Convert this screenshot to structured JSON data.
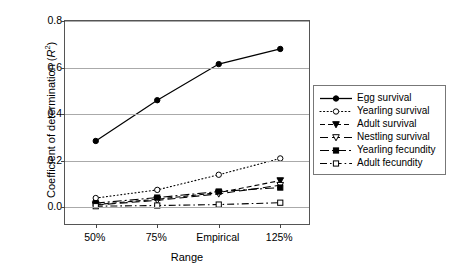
{
  "chart_data": {
    "type": "line",
    "title": "",
    "xlabel": "Range",
    "ylabel": "Coefficient of determination (R2)",
    "ylabel_prefix": "Coefficient of determination (",
    "ylabel_italic": "R",
    "ylabel_superscript": "2",
    "ylabel_suffix": ")",
    "categories": [
      "50%",
      "75%",
      "Empirical",
      "125%"
    ],
    "yticks": [
      "0.8",
      "0.6",
      "0.4",
      "0.2",
      "0.0"
    ],
    "ytick_values": [
      0.8,
      0.6,
      0.4,
      0.2,
      0.0
    ],
    "ylim": [
      -0.08,
      0.8
    ],
    "grid": "horizontal",
    "legend_position": "right",
    "series": [
      {
        "name": "Egg survival",
        "values": [
          0.285,
          0.46,
          0.615,
          0.68
        ],
        "marker": "filled-circle",
        "dash": "solid",
        "color": "#000000"
      },
      {
        "name": "Yearling survival",
        "values": [
          0.04,
          0.075,
          0.14,
          0.21
        ],
        "marker": "open-circle",
        "dash": "dotted",
        "color": "#000000"
      },
      {
        "name": "Adult survival",
        "values": [
          0.012,
          0.035,
          0.063,
          0.115
        ],
        "marker": "filled-triangle-down",
        "dash": "dashed",
        "color": "#000000"
      },
      {
        "name": "Nestling survival",
        "values": [
          0.01,
          0.03,
          0.058,
          0.095
        ],
        "marker": "open-triangle-down",
        "dash": "long-dash",
        "color": "#000000"
      },
      {
        "name": "Yearling fecundity",
        "values": [
          0.018,
          0.042,
          0.068,
          0.085
        ],
        "marker": "filled-square",
        "dash": "dash-dot-long",
        "color": "#000000"
      },
      {
        "name": "Adult fecundity",
        "values": [
          0.005,
          0.008,
          0.012,
          0.02
        ],
        "marker": "open-square",
        "dash": "dash-dot",
        "color": "#000000"
      }
    ]
  }
}
